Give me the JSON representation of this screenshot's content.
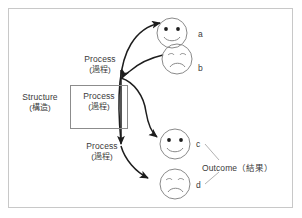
{
  "figure": {
    "type": "structure-process-outcome-diagram",
    "border_color": "#c8c8c8",
    "ink_color": "#3a3a3a",
    "background": "#ffffff"
  },
  "structure": {
    "label_en": "Structure",
    "label_jp": "(構造)"
  },
  "process_box": {
    "label_en": "Process",
    "label_jp": "(過程)"
  },
  "process_top": {
    "label_en": "Process",
    "label_jp": "(過程)"
  },
  "process_bottom": {
    "label_en": "Process",
    "label_jp": "(過程)"
  },
  "outcome": {
    "label": "Outcome（結果）"
  },
  "outcomes": [
    {
      "tag": "a",
      "mood": "happy"
    },
    {
      "tag": "b",
      "mood": "sad"
    },
    {
      "tag": "c",
      "mood": "happy"
    },
    {
      "tag": "d",
      "mood": "sad"
    }
  ]
}
